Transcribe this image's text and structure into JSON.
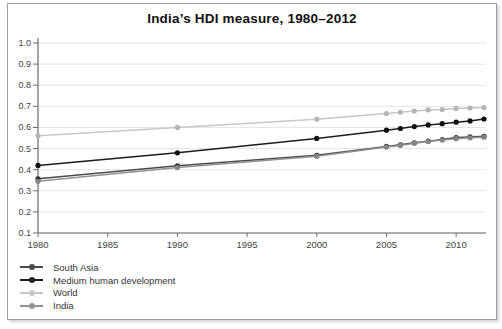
{
  "chart_data": {
    "type": "line",
    "title": "India’s HDI measure, 1980–2012",
    "xlabel": "",
    "ylabel": "",
    "xlim": [
      1980,
      2012
    ],
    "ylim": [
      0.1,
      1.0
    ],
    "grid": "horizontal-only",
    "legend_position": "bottom-left",
    "x": [
      1980,
      1990,
      2000,
      2005,
      2006,
      2007,
      2008,
      2009,
      2010,
      2011,
      2012
    ],
    "x_tick_labels": [
      "1980",
      "1985",
      "1990",
      "1995",
      "2000",
      "2005",
      "2010"
    ],
    "y_tick_labels": [
      "1.0",
      "0.9",
      "0.8",
      "0.7",
      "0.6",
      "0.5",
      "0.4",
      "0.3",
      "0.2",
      "0.1"
    ],
    "series": [
      {
        "name": "South Asia",
        "color": "#4a4a4a",
        "marker_color": "#2e2e2e",
        "values": [
          0.357,
          0.418,
          0.468,
          0.51,
          0.518,
          0.527,
          0.535,
          0.543,
          0.552,
          0.555,
          0.558
        ]
      },
      {
        "name": "Medium human development",
        "color": "#1c1c1c",
        "marker_color": "#0f0f0f",
        "values": [
          0.42,
          0.48,
          0.548,
          0.587,
          0.595,
          0.604,
          0.612,
          0.618,
          0.625,
          0.631,
          0.64
        ]
      },
      {
        "name": "World",
        "color": "#c7c7c7",
        "marker_color": "#b5b5b5",
        "values": [
          0.561,
          0.6,
          0.639,
          0.666,
          0.672,
          0.678,
          0.683,
          0.685,
          0.69,
          0.692,
          0.694
        ]
      },
      {
        "name": "India",
        "color": "#929292",
        "marker_color": "#858585",
        "values": [
          0.345,
          0.41,
          0.463,
          0.507,
          0.515,
          0.525,
          0.533,
          0.54,
          0.547,
          0.551,
          0.554
        ]
      }
    ],
    "colors": {
      "grid": "#e4e4e4",
      "axis": "#6b6b6b",
      "tick_text": "#444444",
      "legend_text": "#333333",
      "frame_border": "#9e9e9e",
      "title_text": "#111111",
      "background": "#ffffff"
    }
  }
}
